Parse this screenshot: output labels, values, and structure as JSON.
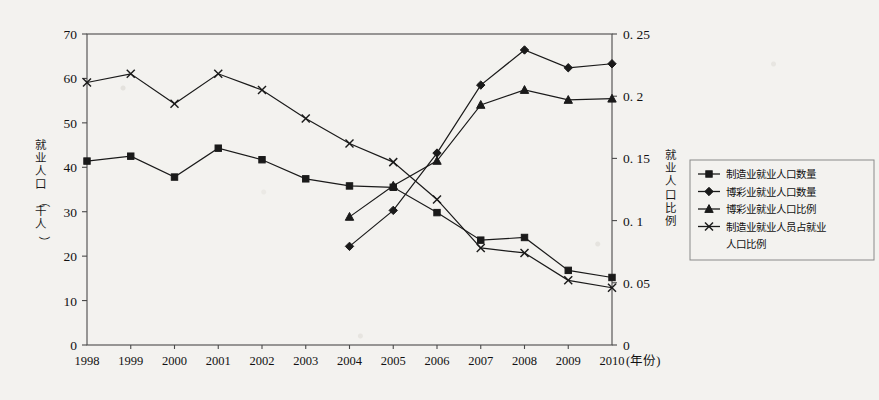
{
  "chart_data": {
    "type": "line",
    "title": "",
    "subtitle": "",
    "xlabel": "(年份)",
    "ylabel": "就业人口（千人）",
    "y2label": "就业人口比例",
    "x": [
      1998,
      1999,
      2000,
      2001,
      2002,
      2003,
      2004,
      2005,
      2006,
      2007,
      2008,
      2009,
      2010
    ],
    "xtick_labels": [
      "1998",
      "1999",
      "2000",
      "2001",
      "2002",
      "2003",
      "2004",
      "2005",
      "2006",
      "2007",
      "2008",
      "2009",
      "2010"
    ],
    "ylim": [
      0,
      70
    ],
    "yticks": [
      0,
      10,
      20,
      30,
      40,
      50,
      60,
      70
    ],
    "ytick_labels": [
      "0",
      "10",
      "20",
      "30",
      "40",
      "50",
      "60",
      "70"
    ],
    "y2lim": [
      0,
      0.25
    ],
    "y2ticks": [
      0,
      0.05,
      0.1,
      0.15,
      0.2,
      0.25
    ],
    "y2tick_labels": [
      "0",
      "0. 05",
      "0. 1",
      "0. 15",
      "0. 2",
      "0. 25"
    ],
    "grid": false,
    "legend_position": "right",
    "series": [
      {
        "name": "制造业就业人口数量",
        "marker": "square",
        "axis": "left",
        "x": [
          1998,
          1999,
          2000,
          2001,
          2002,
          2003,
          2004,
          2005,
          2006,
          2007,
          2008,
          2009,
          2010
        ],
        "values": [
          41.4,
          42.5,
          37.8,
          44.3,
          41.7,
          37.4,
          35.8,
          35.5,
          29.8,
          23.6,
          24.2,
          16.8,
          15.2
        ]
      },
      {
        "name": "博彩业就业人口数量",
        "marker": "diamond",
        "axis": "left",
        "x": [
          2004,
          2005,
          2006,
          2007,
          2008,
          2009,
          2010
        ],
        "values": [
          22.2,
          30.3,
          43.2,
          58.5,
          66.4,
          62.4,
          63.3
        ]
      },
      {
        "name": "博彩业就业人口比例",
        "marker": "triangle",
        "axis": "right",
        "x": [
          2004,
          2005,
          2006,
          2007,
          2008,
          2009,
          2010
        ],
        "values": [
          0.103,
          0.128,
          0.148,
          0.193,
          0.205,
          0.197,
          0.198
        ]
      },
      {
        "name": "制造业就业人员占就业人口比例",
        "marker": "cross",
        "axis": "right",
        "x": [
          1998,
          1999,
          2000,
          2001,
          2002,
          2003,
          2004,
          2005,
          2006,
          2007,
          2008,
          2009,
          2010
        ],
        "values": [
          0.211,
          0.218,
          0.194,
          0.218,
          0.205,
          0.182,
          0.162,
          0.147,
          0.117,
          0.078,
          0.074,
          0.052,
          0.046
        ]
      }
    ]
  },
  "legend": {
    "entries": [
      {
        "label": "制造业就业人口数量",
        "marker": "square"
      },
      {
        "label": "博彩业就业人口数量",
        "marker": "diamond"
      },
      {
        "label": "博彩业就业人口比例",
        "marker": "triangle"
      },
      {
        "label": "制造业就业人员占就业",
        "marker": "cross"
      },
      {
        "label": "人口比例",
        "marker": "none"
      }
    ]
  },
  "colors": {
    "line": "#1a1a1a",
    "axis": "#4a4a4a",
    "background": "#f3f2ef",
    "text": "#111111"
  }
}
